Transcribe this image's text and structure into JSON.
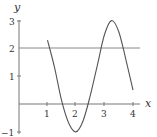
{
  "chart_data": {
    "type": "line",
    "title": "",
    "xlabel": "x",
    "ylabel": "y",
    "xlim": [
      0,
      4.3
    ],
    "ylim": [
      -1,
      3.3
    ],
    "xticks": [
      "1",
      "2",
      "3",
      "4"
    ],
    "yticks": [
      "-1",
      "1",
      "2",
      "3"
    ],
    "grid": false,
    "reference_lines": [
      {
        "type": "horizontal",
        "y": 2
      }
    ],
    "series": [
      {
        "name": "curve",
        "x": [
          1.0,
          1.25,
          1.5,
          1.75,
          2.0,
          2.25,
          2.5,
          2.75,
          3.0,
          3.25,
          3.5,
          3.75,
          4.0
        ],
        "y": [
          2.3,
          1.3,
          0.1,
          -0.7,
          -1.0,
          -0.6,
          0.3,
          1.4,
          2.5,
          3.0,
          2.6,
          1.6,
          0.5
        ]
      }
    ]
  },
  "labels": {
    "x_axis": "x",
    "y_axis": "y",
    "xtick_1": "1",
    "xtick_2": "2",
    "xtick_3": "3",
    "xtick_4": "4",
    "ytick_m1": "−1",
    "ytick_1": "1",
    "ytick_2": "2",
    "ytick_3": "3"
  }
}
